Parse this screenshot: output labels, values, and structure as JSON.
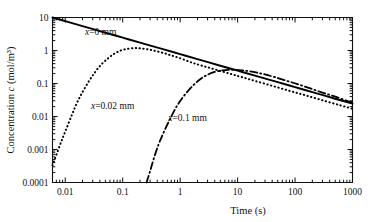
{
  "chart_data": {
    "type": "line",
    "title": "",
    "xlabel": "Time  (s)",
    "ylabel": "Concentration c (mol/m³)",
    "xscale": "log",
    "yscale": "log",
    "xlim": [
      0.006,
      1000
    ],
    "ylim": [
      0.0001,
      10
    ],
    "grid": false,
    "legend_position": "inline-annotations",
    "xticks": [
      0.01,
      0.1,
      1,
      10,
      100,
      1000
    ],
    "xtick_labels": [
      "0.01",
      "0.1",
      "1",
      "10",
      "100",
      "1000"
    ],
    "yticks": [
      0.0001,
      0.001,
      0.01,
      0.1,
      1,
      10
    ],
    "ytick_labels": [
      "0.0001",
      "0.001",
      "0.01",
      "0.1",
      "1",
      "10"
    ],
    "series": [
      {
        "name": "x=0 mm",
        "style": "solid",
        "annotation": "x=0 mm",
        "annotation_x": 0.022,
        "annotation_y": 3.0,
        "x": [
          0.006,
          0.01,
          0.02,
          0.05,
          0.1,
          0.2,
          0.5,
          1,
          2,
          5,
          10,
          20,
          50,
          100,
          200,
          500,
          1000
        ],
        "y": [
          10.0,
          7.75,
          5.48,
          3.47,
          2.45,
          1.73,
          1.1,
          0.775,
          0.548,
          0.347,
          0.245,
          0.173,
          0.11,
          0.0775,
          0.0548,
          0.0347,
          0.0245
        ]
      },
      {
        "name": "x=0.02 mm",
        "style": "dotted",
        "annotation": "x=0.02 mm",
        "annotation_x": 0.028,
        "annotation_y": 0.017,
        "x": [
          0.006,
          0.008,
          0.01,
          0.013,
          0.016,
          0.02,
          0.026,
          0.033,
          0.042,
          0.055,
          0.07,
          0.09,
          0.12,
          0.16,
          0.2,
          0.26,
          0.33,
          0.42,
          0.55,
          0.7,
          0.9,
          1.2,
          1.6,
          2,
          3,
          5,
          8,
          12,
          20,
          40,
          80,
          150,
          300,
          600,
          1000
        ],
        "y": [
          0.00033,
          0.0013,
          0.0035,
          0.011,
          0.026,
          0.055,
          0.12,
          0.22,
          0.37,
          0.57,
          0.78,
          0.98,
          1.12,
          1.18,
          1.16,
          1.1,
          1.02,
          0.92,
          0.81,
          0.71,
          0.62,
          0.52,
          0.43,
          0.38,
          0.31,
          0.24,
          0.19,
          0.155,
          0.12,
          0.085,
          0.06,
          0.044,
          0.031,
          0.022,
          0.0172
        ]
      },
      {
        "name": "x=0.1 mm",
        "style": "dashdot",
        "annotation": "x=0.1 mm",
        "annotation_x": 0.62,
        "annotation_y": 0.0072,
        "x": [
          0.26,
          0.3,
          0.35,
          0.42,
          0.5,
          0.6,
          0.72,
          0.88,
          1.1,
          1.4,
          1.8,
          2.3,
          3.0,
          4.0,
          5.5,
          7.0,
          9.0,
          12,
          16,
          22,
          30,
          45,
          70,
          110,
          180,
          300,
          500,
          800,
          1000
        ],
        "y": [
          0.0001,
          0.00022,
          0.00055,
          0.0014,
          0.0029,
          0.0058,
          0.011,
          0.021,
          0.037,
          0.062,
          0.098,
          0.14,
          0.185,
          0.225,
          0.25,
          0.258,
          0.258,
          0.25,
          0.235,
          0.212,
          0.188,
          0.155,
          0.122,
          0.096,
          0.072,
          0.053,
          0.04,
          0.03,
          0.027
        ]
      }
    ]
  },
  "axes": {
    "x_title": "Time  (s)",
    "y_title_prefix": "Concentration ",
    "y_title_symbol": "c",
    "y_title_suffix": " (mol/m³)"
  },
  "annotations": {
    "curve0": "x=0 mm",
    "curve1": "x=0.02 mm",
    "curve2": "x=0.1 mm"
  }
}
